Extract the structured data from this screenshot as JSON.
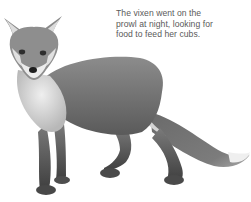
{
  "caption": {
    "lines": [
      "The vixen went on the",
      "prowl at night, looking for",
      "food to feed her cubs."
    ]
  },
  "illustration": {
    "subject": "fox-illustration",
    "style": "grayscale pencil drawing",
    "colors": {
      "fur_dark": "#5e5e5e",
      "fur_mid": "#8a8a8a",
      "fur_light": "#c8c8c8",
      "chest": "#e6e6e6",
      "tail_tip": "#f2f2f2"
    }
  }
}
